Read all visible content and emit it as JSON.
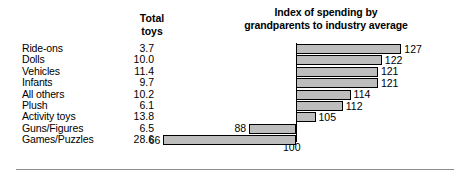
{
  "chart_data": {
    "type": "bar",
    "title": "Index of spending by grandparents to industry average",
    "title_lines": [
      "Index of spending by",
      "grandparents to industry average"
    ],
    "orientation": "horizontal",
    "baseline": 100,
    "baseline_label": "100",
    "xlabel": "",
    "ylabel": "",
    "grid": false,
    "legend": false,
    "categories": [
      "Ride-ons",
      "Dolls",
      "Vehicles",
      "Infants",
      "All others",
      "Plush",
      "Activity toys",
      "Guns/Figures",
      "Games/Puzzles"
    ],
    "values": [
      127,
      122,
      121,
      121,
      114,
      112,
      105,
      88,
      66
    ],
    "series": [
      {
        "name": "Index of spending by grandparents to industry average",
        "values": [
          127,
          122,
          121,
          121,
          114,
          112,
          105,
          88,
          66
        ]
      },
      {
        "name": "Total toys",
        "values": [
          3.7,
          10.0,
          11.4,
          9.7,
          10.2,
          6.1,
          13.8,
          6.5,
          28.6
        ]
      }
    ],
    "xlim": [
      60,
      130
    ],
    "bar_fill_color": "#bdbdbd",
    "bar_edge_color": "#000000"
  },
  "table": {
    "header_lines": [
      "Total",
      "toys"
    ],
    "header": "Total toys",
    "rows": [
      {
        "label": "Ride-ons",
        "total": "3.7",
        "index": "127"
      },
      {
        "label": "Dolls",
        "total": "10.0",
        "index": "122"
      },
      {
        "label": "Vehicles",
        "total": "11.4",
        "index": "121"
      },
      {
        "label": "Infants",
        "total": "9.7",
        "index": "121"
      },
      {
        "label": "All others",
        "total": "10.2",
        "index": "114"
      },
      {
        "label": "Plush",
        "total": "6.1",
        "index": "112"
      },
      {
        "label": "Activity toys",
        "total": "13.8",
        "index": "105"
      },
      {
        "label": "Guns/Figures",
        "total": "6.5",
        "index": "88"
      },
      {
        "label": "Games/Puzzles",
        "total": "28.6",
        "index": "66"
      }
    ]
  }
}
